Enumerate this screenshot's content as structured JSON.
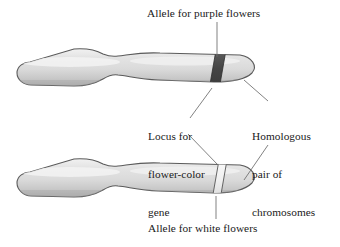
{
  "figure": {
    "name": "homologous-chromosome-pair-diagram",
    "background_color": "#ffffff",
    "width": 340,
    "height": 247
  },
  "labels": {
    "purple_allele": "Allele for purple flowers",
    "locus_line1": "Locus for",
    "locus_line2": "flower-color",
    "locus_line3": "gene",
    "homologous_line1": "Homologous",
    "homologous_line2": "pair of",
    "homologous_line3": "chromosomes",
    "white_allele": "Allele for white flowers"
  },
  "colors": {
    "chromosome_fill_light": "#e6e6e6",
    "chromosome_fill_mid": "#d2d2d2",
    "chromosome_fill_shadow": "#b4b4b4",
    "chromosome_outline": "#5a5a5a",
    "purple_allele_band": "#4a4a4a",
    "white_allele_band": "#f2f2f2",
    "leader_line": "#6b6b6b",
    "text": "#1a1a1a"
  },
  "structures": {
    "upper_chromosome": "upper-chromosome",
    "lower_chromosome": "lower-chromosome",
    "purple_band": "purple-allele-band",
    "white_band": "white-allele-band"
  }
}
